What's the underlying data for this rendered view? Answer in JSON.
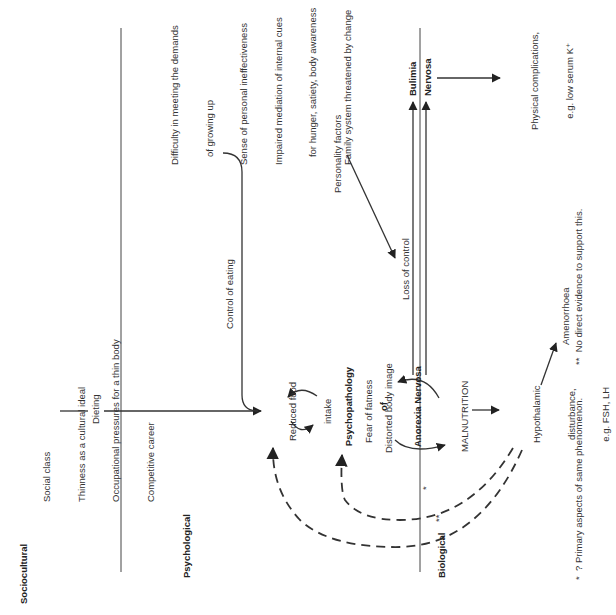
{
  "domains": {
    "sociocultural": "Sociocultural",
    "psychological": "Psychological",
    "biological": "Biological"
  },
  "sociocultural_factors": [
    "Social class",
    "Thinness as a cultural ideal",
    "Occupational pressures for a thin body",
    "Competitive career"
  ],
  "psychological_factors": [
    "Difficulty in meeting the demands",
    "   of growing up",
    "Sense of personal ineffectiveness",
    "Impaired mediation of internal cues",
    "   for hunger, satiety, body awareness",
    "Family system threatened by change"
  ],
  "arrows": {
    "dieting": "Dieting",
    "control_of_eating": "Control of eating",
    "personality_factors": "Personality factors",
    "loss_of_control": "Loss of control"
  },
  "nodes": {
    "reduced_food_intake": [
      "Reduced food",
      "intake"
    ],
    "psychopathology": [
      "Psychopathology",
      "of",
      "Anorexia Nervosa"
    ],
    "fear_of_fatness": "Fear of fatness",
    "distorted_body_image": "Distorted body image",
    "malnutrition": "MALNUTRITION",
    "hypothalamic": [
      "Hypothalamic",
      "disturbance,",
      "e.g. FSH, LH"
    ],
    "amenorrhoea": "Amenorrhoea",
    "bulimia": "Bulimia",
    "nervosa": "Nervosa",
    "physical_complications": [
      "Physical complications,",
      "e.g. low serum K⁺"
    ]
  },
  "markers": {
    "single": "*",
    "double": "**"
  },
  "footnotes": {
    "single": "*  ? Primary aspects of same phenomenon.",
    "double": "**  No direct evidence to support this."
  }
}
